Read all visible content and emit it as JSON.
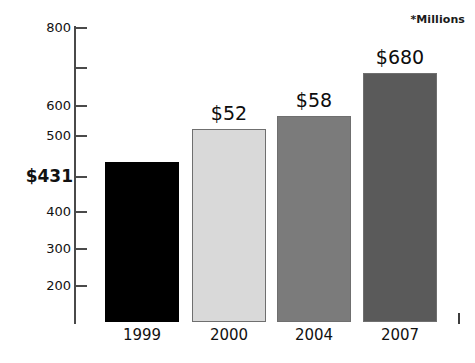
{
  "chart_data": {
    "type": "bar",
    "title": "",
    "subtitle": "",
    "xlabel": "",
    "ylabel": "",
    "annotation": "*Millions",
    "categories": [
      "1999",
      "2000",
      "2004",
      "2007"
    ],
    "values": [
      431,
      520,
      580,
      680
    ],
    "data_labels": [
      "$431",
      "$52",
      "$58",
      "$680"
    ],
    "series": [
      {
        "name": "",
        "values": [
          431,
          520,
          580,
          680
        ]
      }
    ],
    "bar_colors": [
      "#000000",
      "#d9d9d9",
      "#7b7b7b",
      "#5a5a5a"
    ],
    "ylim": [
      150,
      800
    ],
    "grid": false,
    "legend": false,
    "y_ticks": [
      {
        "label": "800",
        "value": 800,
        "emphasis": false,
        "top": 27
      },
      {
        "label": "",
        "value": 700,
        "emphasis": false,
        "top": 67
      },
      {
        "label": "600",
        "value": 600,
        "emphasis": false,
        "top": 105
      },
      {
        "label": "500",
        "value": 500,
        "emphasis": false,
        "top": 135
      },
      {
        "label": "$431",
        "value": 431,
        "emphasis": true,
        "top": 176
      },
      {
        "label": "400",
        "value": 400,
        "emphasis": false,
        "top": 211
      },
      {
        "label": "300",
        "value": 300,
        "emphasis": false,
        "top": 248
      },
      {
        "label": "200",
        "value": 200,
        "emphasis": false,
        "top": 285
      }
    ],
    "bars": [
      {
        "category": "1999",
        "label": "$431",
        "value": 431,
        "color": "#000000",
        "outlined": false,
        "left": 105,
        "width": 74,
        "top": 162,
        "height": 160,
        "label_shown_on_axis": true
      },
      {
        "category": "2000",
        "label": "$52",
        "value": 520,
        "color": "#d9d9d9",
        "outlined": true,
        "left": 192,
        "width": 74,
        "top": 129,
        "height": 193,
        "label_shown_on_axis": false
      },
      {
        "category": "2004",
        "label": "$58",
        "value": 580,
        "color": "#7b7b7b",
        "outlined": true,
        "left": 277,
        "width": 74,
        "top": 116,
        "height": 206,
        "label_shown_on_axis": false
      },
      {
        "category": "2007",
        "label": "$680",
        "value": 680,
        "color": "#5a5a5a",
        "outlined": true,
        "left": 363,
        "width": 74,
        "top": 73,
        "height": 249,
        "label_shown_on_axis": false
      }
    ]
  }
}
